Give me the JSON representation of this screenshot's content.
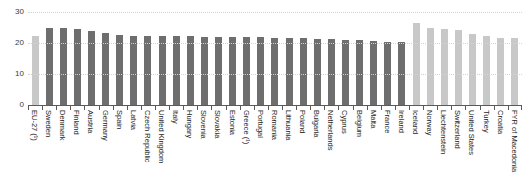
{
  "chart_data": {
    "type": "bar",
    "title": "",
    "xlabel": "",
    "ylabel": "",
    "ylim": [
      0,
      30
    ],
    "yticks": [
      0,
      10,
      20,
      30
    ],
    "grid": true,
    "legend": "none",
    "categories": [
      "EU-27 (¹)",
      "Sweden",
      "Denmark",
      "Finland",
      "Austria",
      "Germany",
      "Spain",
      "Latvia",
      "Czech Republic",
      "United Kingdom",
      "Italy",
      "Hungary",
      "Slovenia",
      "Slovakia",
      "Estonia",
      "Greece (¹)",
      "Portugal",
      "Romania",
      "Lithuania",
      "Poland",
      "Bulgaria",
      "Netherlands",
      "Cyprus",
      "Belgium",
      "Malta",
      "France",
      "Ireland",
      "Iceland",
      "Norway",
      "Liechtenstein",
      "Switzerland",
      "United States",
      "Turkey",
      "Croatia",
      "FYR of Macedonia"
    ],
    "values": [
      22.3,
      25.0,
      25.0,
      24.6,
      23.8,
      23.3,
      22.5,
      22.4,
      22.4,
      22.4,
      22.3,
      22.2,
      22.1,
      22.0,
      22.0,
      21.9,
      21.8,
      21.7,
      21.6,
      21.5,
      21.4,
      21.2,
      21.0,
      20.9,
      20.7,
      20.3,
      20.2,
      26.5,
      24.9,
      24.4,
      24.3,
      22.8,
      22.2,
      21.6,
      21.5
    ],
    "series_note": "single series",
    "bar_styles": [
      "light",
      "dark",
      "dark",
      "dark",
      "dark",
      "dark",
      "dark",
      "dark",
      "dark",
      "dark",
      "dark",
      "dark",
      "dark",
      "dark",
      "dark",
      "dark",
      "dark",
      "dark",
      "dark",
      "dark",
      "dark",
      "dark",
      "dark",
      "dark",
      "dark",
      "dark",
      "dark",
      "light",
      "light",
      "light",
      "light",
      "light",
      "light",
      "light",
      "light"
    ],
    "colors": {
      "bar_dark": "#6e6e6e",
      "bar_light": "#c8c8c8",
      "gridline": "#d2d2d2",
      "axis": "#5a5a5a",
      "text": "#1c1c1c",
      "background": "#ffffff"
    }
  }
}
